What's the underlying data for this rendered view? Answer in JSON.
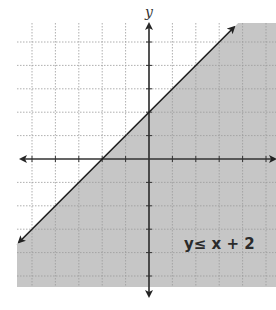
{
  "chart_data": {
    "type": "inequality-graph",
    "title": "",
    "inequality": "y ≤ x + 2",
    "boundary_line": {
      "slope": 1,
      "intercept": 2,
      "style": "solid"
    },
    "shaded_region": "below",
    "xlabel": "",
    "ylabel": "y",
    "xlim": [
      -5.5,
      5.5
    ],
    "ylim": [
      -5.5,
      5.5
    ],
    "grid": true,
    "grid_step": 1,
    "points_on_line": [
      [
        -2,
        0
      ],
      [
        0,
        2
      ],
      [
        1,
        3
      ]
    ],
    "legend": []
  },
  "labels": {
    "y_axis": "y",
    "inequality_label": "y≤ x + 2"
  },
  "colors": {
    "shade": "#c6c6c6",
    "grid": "#9a9a9a",
    "axis": "#333333",
    "line": "#1e1e1e"
  },
  "geometry": {
    "origin_px": [
      149,
      159
    ],
    "unit_px": 23.4,
    "plot_left": 17,
    "plot_right": 276,
    "plot_top": 23,
    "plot_bottom": 287
  }
}
